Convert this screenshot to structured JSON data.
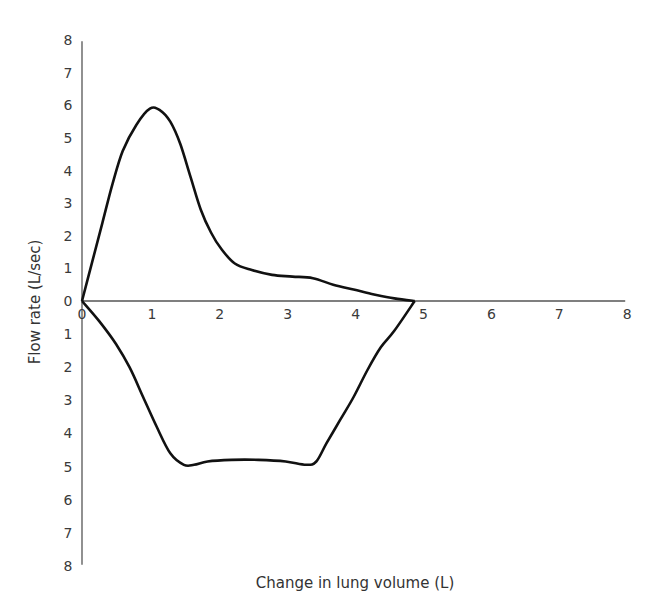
{
  "chart_data": {
    "type": "line",
    "title": "",
    "xlabel": "Change in lung volume (L)",
    "ylabel": "Flow rate (L/sec)",
    "xlim": [
      0,
      8
    ],
    "ylim": [
      -8,
      8
    ],
    "x_ticks": [
      "0",
      "1",
      "2",
      "3",
      "4",
      "5",
      "6",
      "7",
      "8"
    ],
    "y_ticks_upper": [
      "0",
      "1",
      "2",
      "3",
      "4",
      "5",
      "6",
      "7",
      "8"
    ],
    "y_ticks_lower": [
      "1",
      "2",
      "3",
      "4",
      "5",
      "6",
      "7",
      "8"
    ],
    "y_axis_note": "Upper half = expiratory flow (positive), lower half = inspiratory flow (plotted downward, labels unsigned)",
    "grid": false,
    "legend": null,
    "series": [
      {
        "name": "Expiration",
        "points": [
          [
            0,
            0
          ],
          [
            0.15,
            1.2
          ],
          [
            0.3,
            2.4
          ],
          [
            0.45,
            3.6
          ],
          [
            0.6,
            4.6
          ],
          [
            0.8,
            5.4
          ],
          [
            1.0,
            5.9
          ],
          [
            1.15,
            5.85
          ],
          [
            1.3,
            5.5
          ],
          [
            1.45,
            4.8
          ],
          [
            1.6,
            3.8
          ],
          [
            1.75,
            2.8
          ],
          [
            1.9,
            2.1
          ],
          [
            2.05,
            1.6
          ],
          [
            2.25,
            1.15
          ],
          [
            2.5,
            0.95
          ],
          [
            2.8,
            0.8
          ],
          [
            3.1,
            0.75
          ],
          [
            3.4,
            0.7
          ],
          [
            3.7,
            0.5
          ],
          [
            4.0,
            0.35
          ],
          [
            4.3,
            0.2
          ],
          [
            4.6,
            0.08
          ],
          [
            4.9,
            0.0
          ]
        ]
      },
      {
        "name": "Inspiration",
        "points": [
          [
            0,
            0
          ],
          [
            0.25,
            -0.6
          ],
          [
            0.5,
            -1.3
          ],
          [
            0.7,
            -2.0
          ],
          [
            0.9,
            -2.9
          ],
          [
            1.1,
            -3.8
          ],
          [
            1.3,
            -4.6
          ],
          [
            1.5,
            -4.95
          ],
          [
            1.65,
            -4.95
          ],
          [
            1.85,
            -4.85
          ],
          [
            2.2,
            -4.8
          ],
          [
            2.6,
            -4.8
          ],
          [
            3.0,
            -4.85
          ],
          [
            3.3,
            -4.95
          ],
          [
            3.45,
            -4.85
          ],
          [
            3.6,
            -4.3
          ],
          [
            3.8,
            -3.6
          ],
          [
            4.0,
            -2.9
          ],
          [
            4.2,
            -2.1
          ],
          [
            4.4,
            -1.4
          ],
          [
            4.6,
            -0.9
          ],
          [
            4.9,
            0.0
          ]
        ]
      }
    ]
  },
  "labels": {
    "xlabel": "Change in lung volume (L)",
    "ylabel": "Flow rate (L/sec)"
  },
  "colors": {
    "axis": "#555555",
    "curve": "#111111",
    "text": "#333333"
  }
}
